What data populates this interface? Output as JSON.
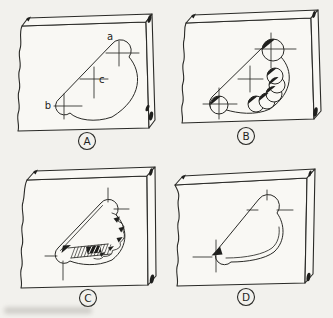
{
  "figure": {
    "paper_color": "#f2f1ed",
    "ink_color": "#2a2a27",
    "panels": [
      {
        "label": "A",
        "points": {
          "a": "a",
          "b": "b",
          "c": "c"
        }
      },
      {
        "label": "B"
      },
      {
        "label": "C"
      },
      {
        "label": "D"
      }
    ]
  }
}
